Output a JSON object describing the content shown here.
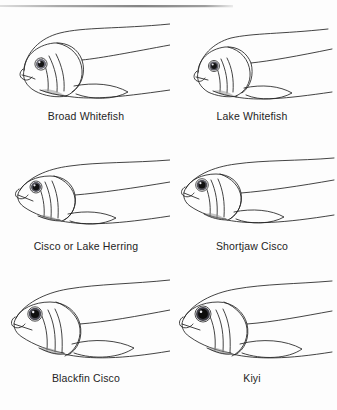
{
  "page": {
    "background_color": "#fdfdfd",
    "ink_color": "#1a1a1a",
    "top_rule": {
      "present": true,
      "color": "#6e6e6e"
    }
  },
  "figures": [
    {
      "id": "broad-whitefish",
      "caption": "Broad Whitefish",
      "row": 1,
      "column": 1,
      "eye": {
        "iris_color": "#4a4a55",
        "pupil_color": "#141414",
        "relative_size": "small"
      },
      "snout": "blunt, rounded, overhanging",
      "body": "deep, robust"
    },
    {
      "id": "lake-whitefish",
      "caption": "Lake Whitefish",
      "row": 1,
      "column": 2,
      "eye": {
        "iris_color": "#4a4a55",
        "pupil_color": "#141414",
        "relative_size": "small"
      },
      "snout": "blunt, rounded, overhanging",
      "body": "deep, robust"
    },
    {
      "id": "cisco-or-lake-herring",
      "caption": "Cisco or Lake Herring",
      "row": 2,
      "column": 1,
      "eye": {
        "iris_color": "#4a4a55",
        "pupil_color": "#141414",
        "relative_size": "medium"
      },
      "snout": "pointed, terminal mouth",
      "body": "slender"
    },
    {
      "id": "shortjaw-cisco",
      "caption": "Shortjaw Cisco",
      "row": 2,
      "column": 2,
      "eye": {
        "iris_color": "#4a4a55",
        "pupil_color": "#141414",
        "relative_size": "medium"
      },
      "snout": "pointed, short lower jaw",
      "body": "slender"
    },
    {
      "id": "blackfin-cisco",
      "caption": "Blackfin Cisco",
      "row": 3,
      "column": 1,
      "eye": {
        "iris_color": "#4a4a55",
        "pupil_color": "#141414",
        "relative_size": "large"
      },
      "snout": "pointed, projecting lower jaw",
      "body": "moderately deep"
    },
    {
      "id": "kiyi",
      "caption": "Kiyi",
      "row": 3,
      "column": 2,
      "eye": {
        "iris_color": "#3b3b44",
        "pupil_color": "#0e0e0e",
        "relative_size": "very large"
      },
      "snout": "pointed, long projecting lower jaw",
      "body": "slender, large-eyed"
    }
  ]
}
